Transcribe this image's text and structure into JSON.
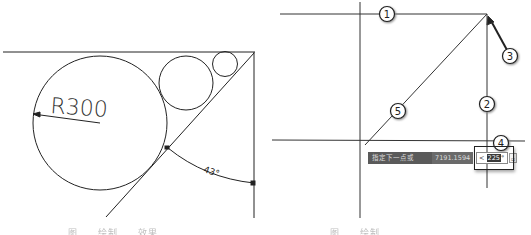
{
  "left_figure": {
    "dimension_label": "R300",
    "angle_label": "43°",
    "caption": "图……绘制……效果"
  },
  "right_figure": {
    "callouts": [
      "1",
      "2",
      "3",
      "4",
      "5"
    ],
    "dynamic_input": {
      "prompt": "指定下一点或",
      "length_value": "7191.1594",
      "angle_prefix": "<",
      "angle_value": "225",
      "angle_unit": "°"
    },
    "caption": "图……绘制……"
  }
}
